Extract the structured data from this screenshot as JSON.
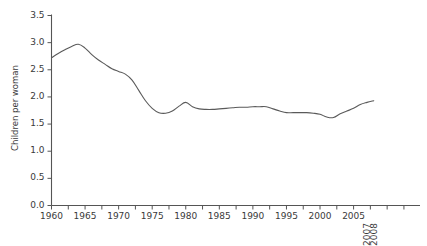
{
  "chart_data": {
    "type": "line",
    "title": "",
    "subtitle": "",
    "xlabel": "",
    "ylabel": "Children per woman",
    "xlim": [
      1960,
      2014
    ],
    "ylim": [
      0.0,
      3.5
    ],
    "grid": false,
    "legend": null,
    "line_color": "#5a5a5a",
    "axis_color": "#555555",
    "text_color": "#3a3a3a",
    "background": "#ffffff",
    "ytick_labels": [
      "0.0",
      "0.5",
      "1.0",
      "1.5",
      "2.0",
      "2.5",
      "3.0",
      "3.5"
    ],
    "ytick_values": [
      0.0,
      0.5,
      1.0,
      1.5,
      2.0,
      2.5,
      3.0,
      3.5
    ],
    "xtick_labels": [
      "1960",
      "1965",
      "1970",
      "1975",
      "1980",
      "1985",
      "1990",
      "1995",
      "2000",
      "2005",
      "2007",
      "2008"
    ],
    "xtick_values": [
      1960,
      1965,
      1970,
      1975,
      1980,
      1985,
      1990,
      1995,
      2000,
      2005,
      2007,
      2008
    ],
    "xtick_rotated": [
      "2007",
      "2008"
    ],
    "minor_tick_interval": 2.5,
    "x": [
      1960,
      1961,
      1962,
      1963,
      1964,
      1965,
      1966,
      1967,
      1968,
      1969,
      1970,
      1971,
      1972,
      1973,
      1974,
      1975,
      1976,
      1977,
      1978,
      1979,
      1980,
      1981,
      1982,
      1983,
      1984,
      1985,
      1986,
      1987,
      1988,
      1989,
      1990,
      1991,
      1992,
      1993,
      1994,
      1995,
      1996,
      1997,
      1998,
      1999,
      2000,
      2001,
      2002,
      2003,
      2004,
      2005,
      2006,
      2007,
      2008
    ],
    "values": [
      2.72,
      2.8,
      2.87,
      2.93,
      2.97,
      2.9,
      2.78,
      2.68,
      2.6,
      2.52,
      2.47,
      2.42,
      2.31,
      2.12,
      1.93,
      1.79,
      1.71,
      1.7,
      1.74,
      1.83,
      1.9,
      1.82,
      1.78,
      1.77,
      1.77,
      1.78,
      1.79,
      1.8,
      1.81,
      1.81,
      1.82,
      1.82,
      1.82,
      1.78,
      1.74,
      1.71,
      1.71,
      1.71,
      1.71,
      1.7,
      1.68,
      1.63,
      1.62,
      1.69,
      1.74,
      1.79,
      1.86,
      1.9,
      1.93
    ]
  }
}
